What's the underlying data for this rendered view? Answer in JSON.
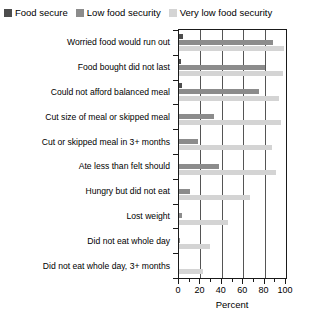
{
  "chart_data": {
    "type": "bar",
    "orientation": "horizontal",
    "title": "",
    "xlabel": "Percent",
    "ylabel": "",
    "xlim": [
      0,
      100
    ],
    "xticks": [
      0,
      20,
      40,
      60,
      80,
      100
    ],
    "xtick_labels": [
      "0",
      "20",
      "40",
      "60",
      "80",
      "100"
    ],
    "xminor_ticks": [
      10,
      30,
      50,
      70,
      90
    ],
    "grid": "vertical",
    "legend_position": "top-left",
    "categories": [
      "Worried food would run out",
      "Food bought did not last",
      "Could not afford balanced meal",
      "Cut size of meal or skipped meal",
      "Cut or skipped meal in 3+ months",
      "Ate less than felt should",
      "Hungry but did not eat",
      "Lost weight",
      "Did not eat whole day",
      "Did not eat whole day, 3+ months"
    ],
    "series": [
      {
        "name": "Food secure",
        "color": "#4d4d4d",
        "values": [
          4,
          2,
          3,
          0,
          0,
          0,
          0,
          0,
          0,
          0
        ]
      },
      {
        "name": "Low food security",
        "color": "#8c8c8c",
        "values": [
          88,
          80,
          75,
          33,
          18,
          37,
          10,
          3,
          1,
          0
        ]
      },
      {
        "name": "Very low food security",
        "color": "#d4d4d4",
        "values": [
          98,
          97,
          93,
          95,
          87,
          91,
          66,
          46,
          29,
          22
        ]
      }
    ]
  },
  "legend": {
    "items": [
      {
        "label": "Food secure",
        "color": "#4d4d4d"
      },
      {
        "label": "Low food security",
        "color": "#8c8c8c"
      },
      {
        "label": "Very low food security",
        "color": "#d4d4d4"
      }
    ]
  },
  "axis": {
    "x_title": "Percent"
  }
}
